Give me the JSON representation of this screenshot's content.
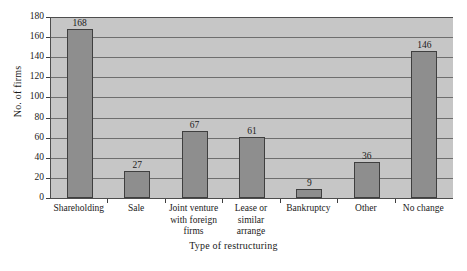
{
  "chart_data": {
    "type": "bar",
    "title": "",
    "xlabel": "Type of restructuring",
    "ylabel": "No. of firms",
    "ylim": [
      0,
      180
    ],
    "ytick_step": 20,
    "yticks": [
      180,
      160,
      140,
      120,
      100,
      80,
      60,
      40,
      20,
      0
    ],
    "grid": true,
    "legend": "none",
    "categories": [
      "Shareholding",
      "Sale",
      "Joint venture\nwith foreign\nfirms",
      "Lease or\nsimilar\narrange",
      "Bankruptcy",
      "Other",
      "No change"
    ],
    "category_lines": [
      [
        "Shareholding"
      ],
      [
        "Sale"
      ],
      [
        "Joint venture",
        "with foreign",
        "firms"
      ],
      [
        "Lease or",
        "similar",
        "arrange"
      ],
      [
        "Bankruptcy"
      ],
      [
        "Other"
      ],
      [
        "No change"
      ]
    ],
    "values": [
      168,
      27,
      67,
      61,
      9,
      36,
      146
    ],
    "value_labels": [
      "168",
      "27",
      "67",
      "61",
      "9",
      "36",
      "146"
    ],
    "colors": {
      "bar_fill": "#8e8e8e",
      "bar_border": "#3f3f3f",
      "plot_background": "#c6c6c6",
      "gridline": "#6e6e6e",
      "axis": "#4d4d4d",
      "text": "#1a1a1a",
      "page_background": "#ffffff"
    }
  }
}
